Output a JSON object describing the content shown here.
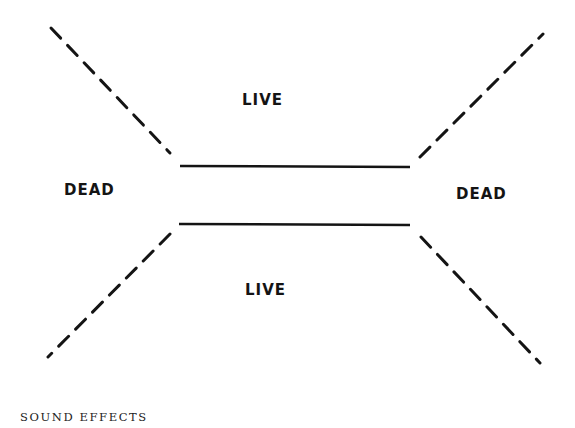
{
  "diagram": {
    "labels": {
      "live_top": "LIVE",
      "live_bottom": "LIVE",
      "dead_left": "DEAD",
      "dead_right": "DEAD"
    },
    "caption": "SOUND EFFECTS",
    "colors": {
      "ink": "#141414",
      "background": "#ffffff"
    }
  }
}
